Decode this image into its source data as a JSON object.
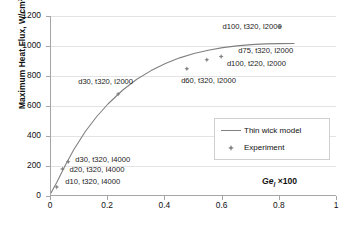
{
  "chart_data": {
    "type": "scatter",
    "title": "",
    "xlabel": "Ge_l ×100",
    "xlabel_parts": {
      "symbol": "Ge",
      "subscript": "l",
      "suffix": "×100"
    },
    "ylabel": "Maximum Heat Flux,  W/cm2",
    "ylabel_parts": {
      "text": "Maximum Heat Flux,  W/cm",
      "sup": "2"
    },
    "xlim": [
      0,
      1
    ],
    "ylim": [
      0,
      1200
    ],
    "xticks": [
      "0",
      "0.2",
      "0.4",
      "0.6",
      "0.8",
      "1"
    ],
    "xtick_values": [
      0,
      0.2,
      0.4,
      0.6,
      0.8,
      1
    ],
    "yticks": [
      "0",
      "200",
      "400",
      "600",
      "800",
      "1000",
      "1200"
    ],
    "ytick_values": [
      0,
      200,
      400,
      600,
      800,
      1000,
      1200
    ],
    "grid": "horizontal",
    "legend_position": "center-right",
    "legend": [
      {
        "label": "Thin wick model",
        "style": "line",
        "color": "#808080"
      },
      {
        "label": "Experiment",
        "style": "marker",
        "color": "#808080"
      }
    ],
    "series": [
      {
        "name": "Experiment",
        "type": "scatter",
        "color": "#808080",
        "points": [
          {
            "x": 0.02,
            "y": 60,
            "label": "d10, t320, I4000"
          },
          {
            "x": 0.04,
            "y": 180,
            "label": "d20, t320, I4000"
          },
          {
            "x": 0.06,
            "y": 228,
            "label": "d30, t320, I4000"
          },
          {
            "x": 0.235,
            "y": 680,
            "label": "d30, t320, I2000"
          },
          {
            "x": 0.475,
            "y": 848,
            "label": "d60, t320, I2000"
          },
          {
            "x": 0.545,
            "y": 908,
            "label": "d100, t220, I2000"
          },
          {
            "x": 0.595,
            "y": 930,
            "label": "d75, t320, I2000"
          },
          {
            "x": 0.8,
            "y": 1128,
            "label": "d100, t320, I2000"
          }
        ]
      },
      {
        "name": "Thin wick model",
        "type": "line",
        "color": "#808080",
        "x": [
          0.0,
          0.02,
          0.05,
          0.08,
          0.12,
          0.16,
          0.2,
          0.25,
          0.3,
          0.35,
          0.4,
          0.45,
          0.5,
          0.55,
          0.6,
          0.65,
          0.7,
          0.75,
          0.8,
          0.85
        ],
        "y": [
          20,
          90,
          205,
          310,
          430,
          530,
          615,
          705,
          778,
          836,
          884,
          921,
          950,
          972,
          989,
          1001,
          1009,
          1014,
          1016,
          1017
        ]
      }
    ],
    "annotations": [
      {
        "text": "d100, t320, I2000",
        "x": 0.6,
        "y": 1128
      },
      {
        "text": "d75, t320, I2000",
        "x": 0.655,
        "y": 968
      },
      {
        "text": "d100, t220, I2000",
        "x": 0.615,
        "y": 880
      },
      {
        "text": "d60, t320, I2000",
        "x": 0.455,
        "y": 770
      },
      {
        "text": "d30, t320, I2000",
        "x": 0.095,
        "y": 760
      },
      {
        "text": "d30, t320, I4000",
        "x": 0.085,
        "y": 238
      },
      {
        "text": "d20, t320, I4000",
        "x": 0.065,
        "y": 172
      },
      {
        "text": "d10, t320, I4000",
        "x": 0.05,
        "y": 92
      }
    ]
  }
}
